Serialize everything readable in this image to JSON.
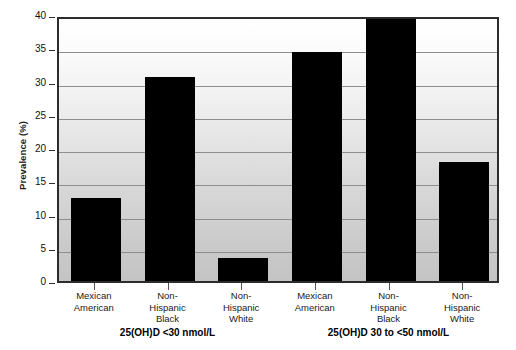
{
  "chart_data": {
    "type": "bar",
    "title": "",
    "xlabel": "",
    "ylabel": "Prevalence (%)",
    "ylim": [
      0,
      40
    ],
    "yticks": [
      0,
      5,
      10,
      15,
      20,
      25,
      30,
      35,
      40
    ],
    "grid": true,
    "legend": "none",
    "bar_color": "#000000",
    "groups": [
      {
        "label": "25(OH)D <30 nmol/L",
        "categories": [
          "Mexican American",
          "Non-Hispanic Black",
          "Non-Hispanic White"
        ],
        "values": [
          12.5,
          30.7,
          3.4
        ]
      },
      {
        "label": "25(OH)D 30 to <50 nmol/L",
        "categories": [
          "Mexican American",
          "Non-Hispanic Black",
          "Non-Hispanic White"
        ],
        "values": [
          34.5,
          39.5,
          17.9
        ]
      }
    ],
    "categories": [
      "Mexican American",
      "Non-Hispanic Black",
      "Non-Hispanic White",
      "Mexican American",
      "Non-Hispanic Black",
      "Non-Hispanic White"
    ],
    "values": [
      12.5,
      30.7,
      3.4,
      34.5,
      39.5,
      17.9
    ],
    "tick_label_lines": [
      [
        "Mexican",
        "American"
      ],
      [
        "Non-",
        "Hispanic",
        "Black"
      ],
      [
        "Non-",
        "Hispanic",
        "White"
      ],
      [
        "Mexican",
        "American"
      ],
      [
        "Non-",
        "Hispanic",
        "Black"
      ],
      [
        "Non-",
        "Hispanic",
        "White"
      ]
    ]
  },
  "axis": {
    "y_title": "Prevalence (%)",
    "y_tick_labels": [
      "0",
      "5",
      "10",
      "15",
      "20",
      "25",
      "30",
      "35",
      "40"
    ]
  },
  "group_labels": {
    "group_1": "25(OH)D <30 nmol/L",
    "group_2": "25(OH)D 30 to <50 nmol/L"
  }
}
